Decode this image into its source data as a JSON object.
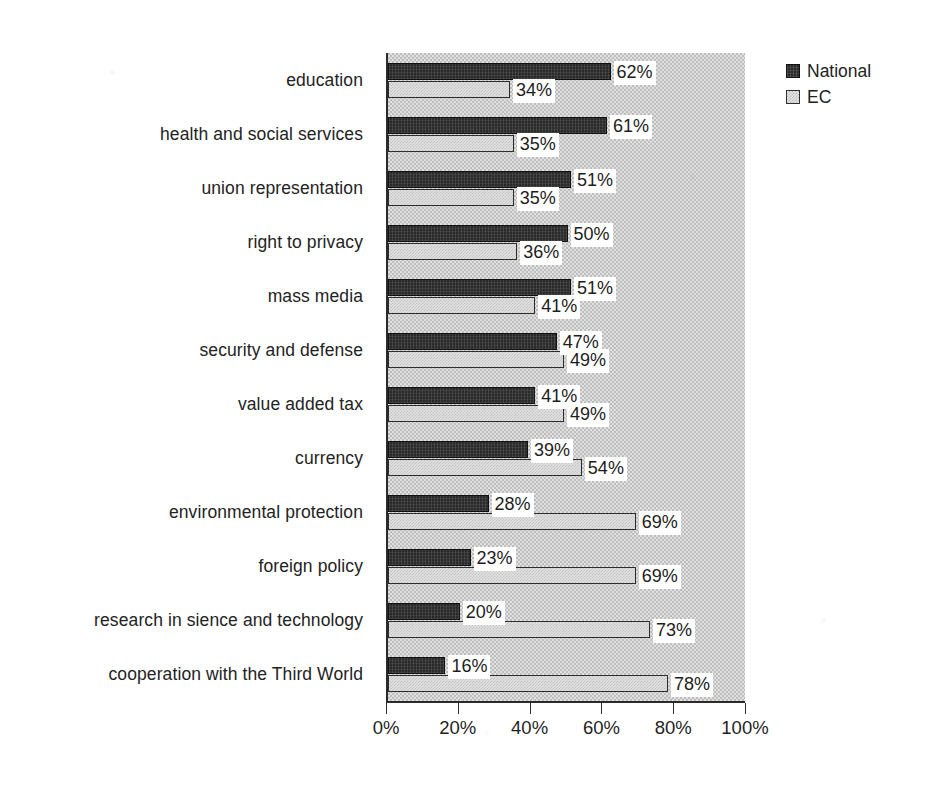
{
  "chart_data": {
    "type": "bar",
    "orientation": "horizontal",
    "title": "",
    "subtitle": "",
    "xlabel": "",
    "ylabel": "",
    "xlim": [
      0,
      100
    ],
    "xticks": [
      0,
      20,
      40,
      60,
      80,
      100
    ],
    "xtick_labels": [
      "0%",
      "20%",
      "40%",
      "60%",
      "80%",
      "100%"
    ],
    "grid": false,
    "legend_position": "top-right",
    "value_suffix": "%",
    "categories": [
      "education",
      "health and social services",
      "union representation",
      "right to privacy",
      "mass media",
      "security and defense",
      "value added tax",
      "currency",
      "environmental protection",
      "foreign policy",
      "research in sience and technology",
      "cooperation with the Third World"
    ],
    "series": [
      {
        "name": "National",
        "color": "#2a2a2a",
        "values": [
          62,
          61,
          51,
          50,
          51,
          47,
          41,
          39,
          28,
          23,
          20,
          16
        ],
        "labels": [
          "62%",
          "61%",
          "51%",
          "50%",
          "51%",
          "47%",
          "41%",
          "39%",
          "28%",
          "23%",
          "20%",
          "16%"
        ]
      },
      {
        "name": "EC",
        "color": "#e2e2e2",
        "values": [
          34,
          35,
          35,
          36,
          41,
          49,
          49,
          54,
          69,
          69,
          73,
          78
        ],
        "labels": [
          "34%",
          "35%",
          "35%",
          "36%",
          "41%",
          "49%",
          "49%",
          "54%",
          "69%",
          "69%",
          "73%",
          "78%"
        ]
      }
    ]
  },
  "legend": {
    "items": [
      {
        "label": "National",
        "swatch": "dark-swatch"
      },
      {
        "label": "EC",
        "swatch": "light-swatch"
      }
    ]
  }
}
